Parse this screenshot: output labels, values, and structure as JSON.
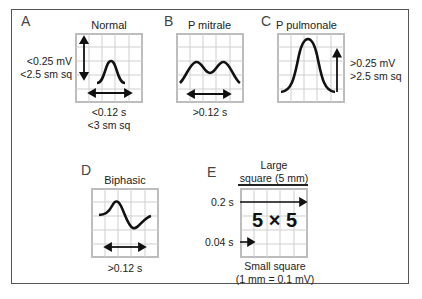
{
  "figure": {
    "panels": [
      {
        "letter": "A",
        "title": "Normal",
        "amplitude_label": [
          "<0.25 mV",
          "<2.5 sm sq"
        ],
        "duration_label": [
          "<0.12 s",
          "<3 sm sq"
        ],
        "waveform": "normal-p-wave"
      },
      {
        "letter": "B",
        "title": "P mitrale",
        "duration_label": [
          ">0.12 s"
        ],
        "waveform": "notched-p-wave"
      },
      {
        "letter": "C",
        "title": "P pulmonale",
        "amplitude_label": [
          ">0.25 mV",
          ">2.5 sm sq"
        ],
        "waveform": "tall-peaked-p-wave"
      },
      {
        "letter": "D",
        "title": "Biphasic",
        "duration_label": [
          ">0.12 s"
        ],
        "waveform": "biphasic-p-wave"
      },
      {
        "letter": "E",
        "title": [
          "Large",
          "square (5 mm)"
        ],
        "large_time": "0.2 s",
        "small_time": "0.04 s",
        "center_text": "5 × 5",
        "bottom_label": [
          "Small square",
          "(1 mm = 0.1 mV)"
        ]
      }
    ],
    "colors": {
      "grid": "#c8c8c8",
      "grid_border": "#bdbdbd",
      "waveform": "#111111",
      "frame": "#555555"
    }
  }
}
